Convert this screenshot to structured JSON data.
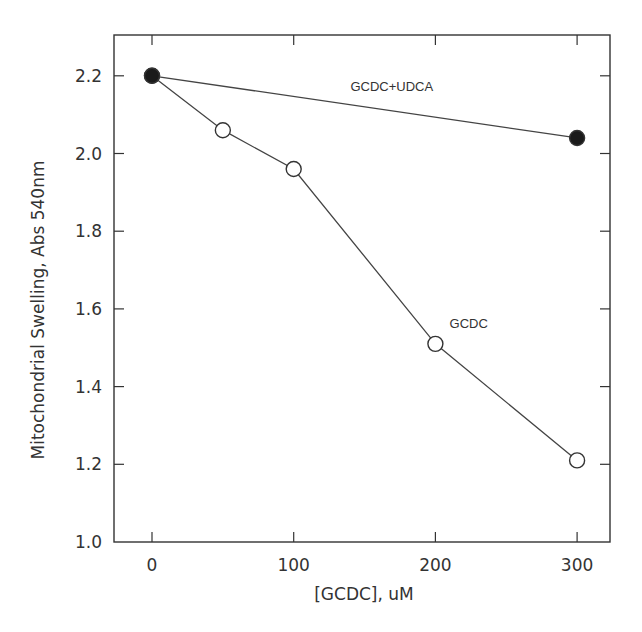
{
  "chart_data": {
    "type": "line",
    "title": "",
    "xlabel": "[GCDC], uM",
    "ylabel": "Mitochondrial Swelling, Abs 540nm",
    "xlim": [
      -25,
      325
    ],
    "ylim": [
      1.0,
      2.3
    ],
    "x_ticks": [
      0,
      100,
      200,
      300
    ],
    "x_tick_labels": [
      "0",
      "100",
      "200",
      "300"
    ],
    "y_ticks": [
      1.0,
      1.2,
      1.4,
      1.6,
      1.8,
      2.0,
      2.2
    ],
    "y_tick_labels": [
      "1.0",
      "1.2",
      "1.4",
      "1.6",
      "1.8",
      "2.0",
      "2.2"
    ],
    "grid": false,
    "legend": "inline labels",
    "series": [
      {
        "name": "GCDC+UDCA",
        "marker": "filled-circle",
        "x": [
          0,
          300
        ],
        "values": [
          2.2,
          2.04
        ],
        "label_pos": {
          "x": 140,
          "y": 2.16
        }
      },
      {
        "name": "GCDC",
        "marker": "open-circle",
        "x": [
          0,
          50,
          100,
          200,
          300
        ],
        "values": [
          2.2,
          2.06,
          1.96,
          1.51,
          1.21
        ],
        "label_pos": {
          "x": 210,
          "y": 1.55
        }
      }
    ]
  }
}
